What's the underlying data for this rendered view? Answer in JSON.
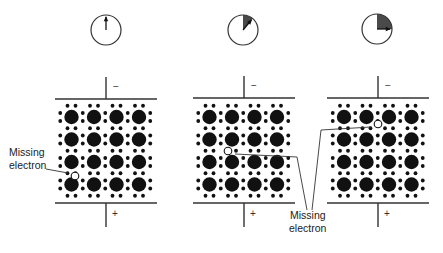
{
  "figure": {
    "colors": {
      "ink": "#111111",
      "shade": "#4a4a4a",
      "line": "#333333",
      "background": "#ffffff"
    },
    "lattice": {
      "rows": 4,
      "cols": 4,
      "spacing": 22.5,
      "atom_radius": 7.2,
      "electron_radius": 1.9
    },
    "panels": [
      {
        "id": "panel-1",
        "clock": {
          "cx": 106,
          "cy": 30,
          "r": 15,
          "sweep_deg": 0,
          "hand_deg": 0
        },
        "plate_top_y": 99,
        "plate_bottom_y": 203,
        "plate_x1": 55,
        "plate_x2": 157,
        "lead_x": 106,
        "origin_x": 71.5,
        "origin_y": 117,
        "neg_label": "−",
        "pos_label": "+",
        "hole": {
          "x": 75,
          "y": 176
        },
        "removed": [
          [
            71,
            176
          ]
        ]
      },
      {
        "id": "panel-2",
        "clock": {
          "cx": 243,
          "cy": 30,
          "r": 15,
          "sweep_deg": 40,
          "hand_deg": 40
        },
        "plate_top_y": 98,
        "plate_bottom_y": 203,
        "plate_x1": 193,
        "plate_x2": 295,
        "lead_x": 244,
        "origin_x": 209.5,
        "origin_y": 117,
        "neg_label": "−",
        "pos_label": "+",
        "hole": {
          "x": 228,
          "y": 151
        },
        "removed": [
          [
            232,
            151
          ]
        ]
      },
      {
        "id": "panel-3",
        "clock": {
          "cx": 377,
          "cy": 29,
          "r": 15,
          "sweep_deg": 90,
          "hand_deg": 90
        },
        "plate_top_y": 98,
        "plate_bottom_y": 203,
        "plate_x1": 327,
        "plate_x2": 429,
        "lead_x": 378,
        "origin_x": 344,
        "origin_y": 117,
        "neg_label": "−",
        "pos_label": "+",
        "hole": {
          "x": 378,
          "y": 124
        },
        "removed": [
          [
            383,
            124
          ]
        ]
      }
    ],
    "labels": {
      "left": {
        "line1": "Missing",
        "line2": "electron"
      },
      "shared": {
        "line1": "Missing",
        "line2": "electron"
      }
    },
    "leaders": [
      {
        "points": [
          [
            46,
            169
          ],
          [
            68,
            173
          ]
        ]
      },
      {
        "points": [
          [
            235,
            154
          ],
          [
            297,
            157
          ],
          [
            307,
            210
          ]
        ]
      },
      {
        "points": [
          [
            371,
            127
          ],
          [
            321,
            130
          ],
          [
            312,
            210
          ]
        ]
      }
    ]
  }
}
